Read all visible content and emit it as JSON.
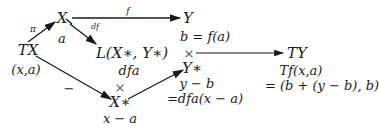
{
  "nodes": {
    "X": {
      "label": "X",
      "sub": "a"
    },
    "Y": {
      "label": "Y",
      "sub": "b = f(a)"
    },
    "TX": {
      "label": "TX",
      "sub": "(x,a)"
    },
    "L": {
      "label": "L(X∗, Y∗)",
      "sub": "dfa"
    },
    "TY": {
      "label": "TY",
      "sub": "Tf(x,a)",
      "sub2": "= (b + (y − b), b)"
    },
    "Ystar": {
      "label": "Y∗",
      "sub": "y − b",
      "sub2": "=dfa(x − a)"
    },
    "Xstar": {
      "label": "X∗",
      "sub": "x − a"
    }
  },
  "arrows": {
    "pi": {
      "label": "π"
    },
    "f": {
      "label": "f"
    },
    "df": {
      "label": "df"
    },
    "minus": {
      "label": "−"
    }
  },
  "products": {
    "upper": "×",
    "lower": "×"
  }
}
